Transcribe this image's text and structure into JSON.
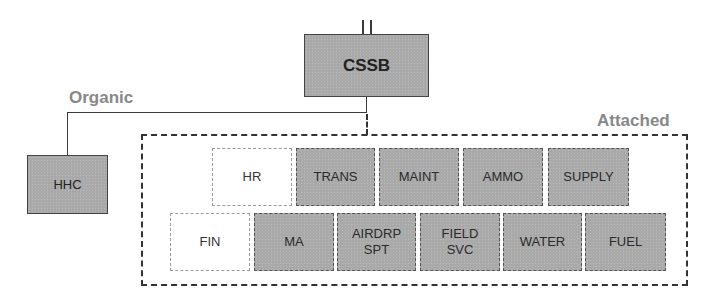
{
  "diagram": {
    "headquarters": {
      "label": "CSSB",
      "echelon_marker": "II"
    },
    "organic": {
      "group_label": "Organic",
      "units": [
        {
          "label": "HHC"
        }
      ]
    },
    "attached": {
      "group_label": "Attached",
      "row1": [
        {
          "label": "HR",
          "style": "empty"
        },
        {
          "label": "TRANS",
          "style": "filled"
        },
        {
          "label": "MAINT",
          "style": "filled"
        },
        {
          "label": "AMMO",
          "style": "filled"
        },
        {
          "label": "SUPPLY",
          "style": "filled"
        }
      ],
      "row2": [
        {
          "label": "FIN",
          "style": "empty"
        },
        {
          "label": "MA",
          "style": "filled"
        },
        {
          "label": "AIRDRP\nSPT",
          "style": "filled"
        },
        {
          "label": "FIELD\nSVC",
          "style": "filled"
        },
        {
          "label": "WATER",
          "style": "filled"
        },
        {
          "label": "FUEL",
          "style": "filled"
        }
      ]
    },
    "colors": {
      "unit_fill": "#a9a9a9",
      "group_label": "#888888",
      "line": "#3a3a3a"
    }
  }
}
